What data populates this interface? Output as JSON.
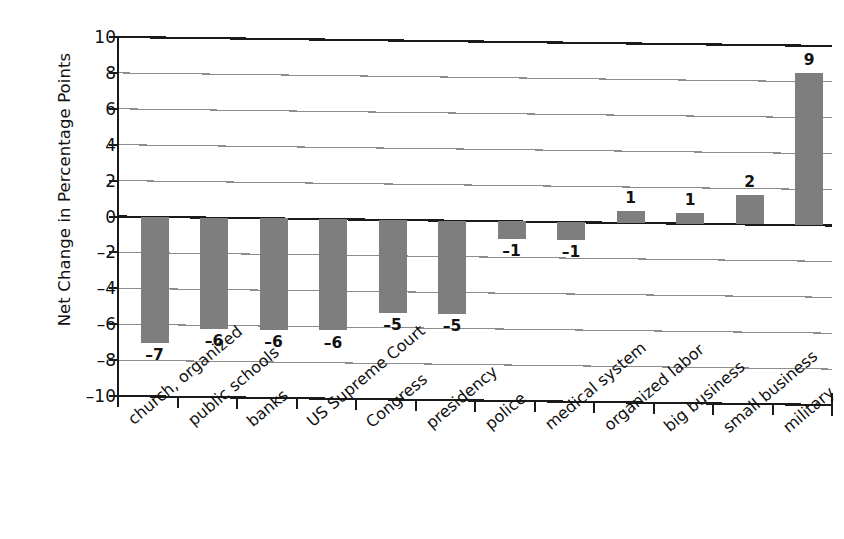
{
  "chart_data": {
    "type": "bar",
    "title": "",
    "subtitle": "",
    "xlabel": "",
    "ylabel": "Net Change in Percentage Points",
    "ylim": [
      -10,
      10
    ],
    "ytick_values": [
      10,
      8,
      6,
      4,
      2,
      0,
      -2,
      -4,
      -6,
      -8,
      -10
    ],
    "ytick_labels": [
      "10",
      "8",
      "6",
      "4",
      "2",
      "0",
      "–2",
      "–4",
      "–6",
      "–8",
      "–10"
    ],
    "grid": true,
    "grid_axis": "y",
    "legend": false,
    "legend_position": "none",
    "bar_color": "#7e7e7e",
    "axis_color": "#1a1a1a",
    "grid_color": "#8d8d8d",
    "categories": [
      "church, organized",
      "public schools",
      "banks",
      "US Supreme Court",
      "Congress",
      "presidency",
      "police",
      "medical system",
      "organized labor",
      "big business",
      "small business",
      "military"
    ],
    "values": [
      -7,
      -6,
      -6,
      -6,
      -5,
      -5,
      -1,
      -1,
      1,
      1,
      2,
      9
    ],
    "data_labels": [
      "–7",
      "–6",
      "–6",
      "–6",
      "–5",
      "–5",
      "–1",
      "–1",
      "1",
      "1",
      "2",
      "9"
    ],
    "bar_draw_heights": [
      -7.0,
      -6.2,
      -6.2,
      -6.2,
      -5.2,
      -5.2,
      -1.0,
      -1.0,
      0.65,
      0.6,
      1.65,
      8.5
    ]
  }
}
